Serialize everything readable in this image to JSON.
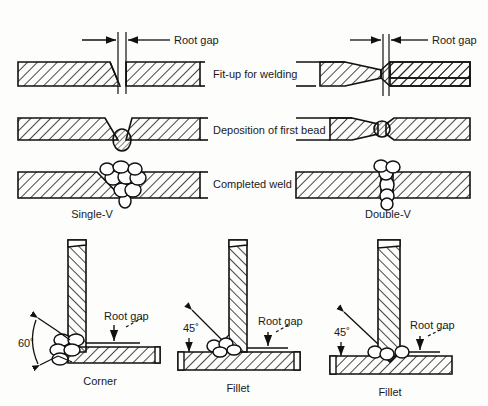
{
  "figure": {
    "stroke_color": "#111111",
    "hatch_color": "#1a1a1a",
    "background_color": "#fdfdfb",
    "bead_fill": "#ffffff"
  },
  "rows": [
    {
      "id": "row-fitup",
      "label": "Fit-up for welding"
    },
    {
      "id": "row-firstbead",
      "label": "Deposition of first bead"
    },
    {
      "id": "row-completed",
      "label": "Completed weld"
    }
  ],
  "annotations": {
    "root_gap": "Root gap",
    "angle_60": "60˚",
    "angle_45": "45˚"
  },
  "butt_joints": [
    {
      "id": "single-v",
      "caption": "Single-V"
    },
    {
      "id": "double-v",
      "caption": "Double-V"
    }
  ],
  "corner_joints": [
    {
      "id": "corner",
      "caption": "Corner",
      "angle": "60˚",
      "root_gap": "Root gap"
    },
    {
      "id": "fillet1",
      "caption": "Fillet",
      "angle": "45˚",
      "root_gap": "Root gap"
    },
    {
      "id": "fillet2",
      "caption": "Fillet",
      "angle": "45˚",
      "root_gap": "Root gap"
    }
  ]
}
